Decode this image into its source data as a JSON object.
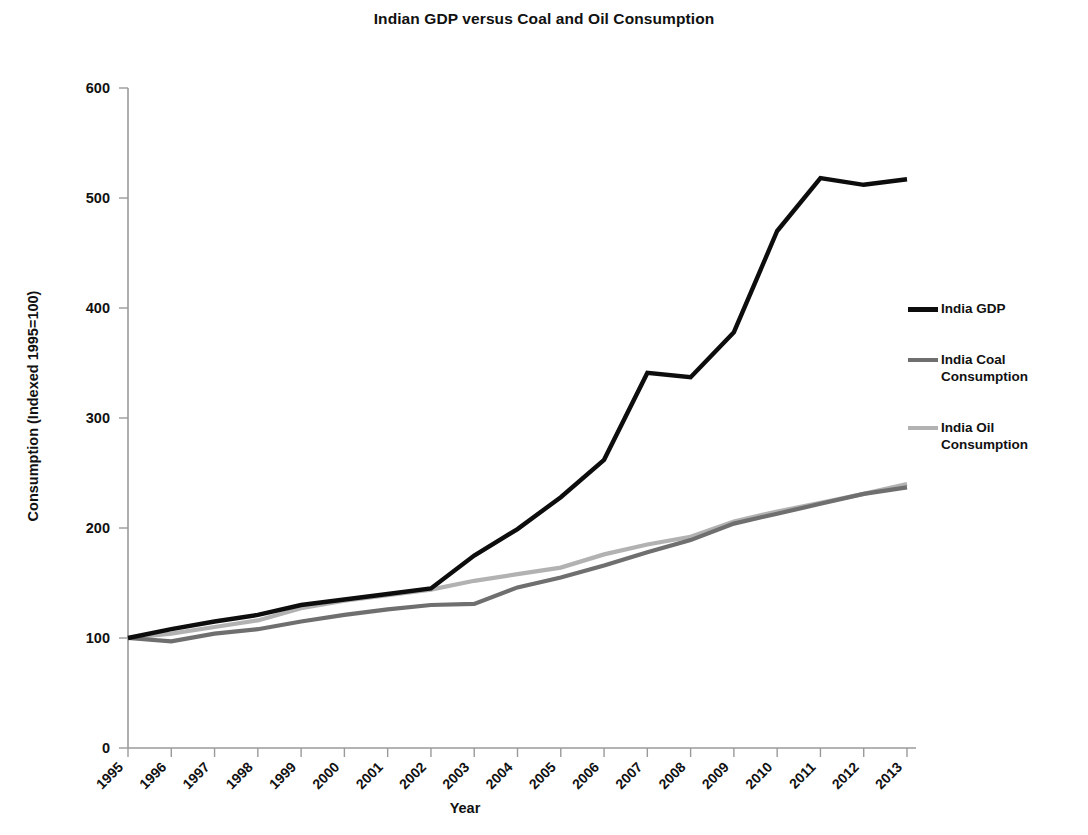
{
  "chart_data": {
    "type": "line",
    "title": "Indian GDP versus Coal and Oil Consumption",
    "xlabel": "Year",
    "ylabel": "Consumption (Indexed 1995=100)",
    "ylim": [
      0,
      600
    ],
    "ytick_values": [
      0,
      100,
      200,
      300,
      400,
      500,
      600
    ],
    "ytick_labels": [
      "0",
      "100",
      "200",
      "300",
      "400",
      "500",
      "600"
    ],
    "grid": false,
    "legend_position": "right",
    "categories": [
      1995,
      1996,
      1997,
      1998,
      1999,
      2000,
      2001,
      2002,
      2003,
      2004,
      2005,
      2006,
      2007,
      2008,
      2009,
      2010,
      2011,
      2012,
      2013
    ],
    "xtick_labels": [
      "1995",
      "1996",
      "1997",
      "1998",
      "1999",
      "2000",
      "2001",
      "2002",
      "2003",
      "2004",
      "2005",
      "2006",
      "2007",
      "2008",
      "2009",
      "2010",
      "2011",
      "2012",
      "2013"
    ],
    "series": [
      {
        "name": "India GDP",
        "color": "#0d0d0d",
        "width": 4.4,
        "values": [
          100,
          108,
          115,
          121,
          130,
          135,
          140,
          145,
          175,
          199,
          228,
          262,
          341,
          337,
          378,
          470,
          518,
          512,
          517
        ]
      },
      {
        "name": "India Coal\nConsumption",
        "color": "#6f6f6f",
        "width": 4.2,
        "values": [
          100,
          97,
          104,
          108,
          115,
          121,
          126,
          130,
          131,
          146,
          155,
          166,
          178,
          189,
          204,
          213,
          222,
          231,
          237
        ]
      },
      {
        "name": "India Oil\nConsumption",
        "color": "#b2b2b2",
        "width": 4.2,
        "values": [
          100,
          104,
          110,
          116,
          127,
          134,
          139,
          144,
          152,
          158,
          164,
          176,
          185,
          192,
          206,
          215,
          223,
          231,
          240
        ]
      }
    ]
  },
  "legend": {
    "items": [
      {
        "label": "India GDP",
        "color": "#0d0d0d"
      },
      {
        "label": "India Coal\nConsumption",
        "color": "#6f6f6f"
      },
      {
        "label": "India Oil\nConsumption",
        "color": "#b2b2b2"
      }
    ]
  }
}
